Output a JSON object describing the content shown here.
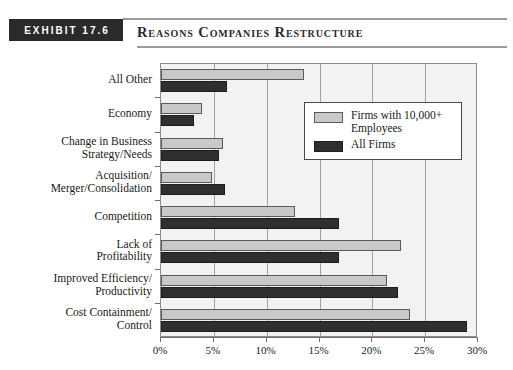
{
  "header": {
    "exhibit_label": "EXHIBIT 17.6",
    "title": "Reasons Companies Restructure"
  },
  "legend": {
    "items": [
      {
        "label": "Firms with 10,000+ Employees",
        "color": "#c9c9c9"
      },
      {
        "label": "All Firms",
        "color": "#2f2f2f"
      }
    ]
  },
  "chart_data": {
    "type": "bar",
    "orientation": "horizontal",
    "title": "Reasons Companies Restructure",
    "xlabel": "",
    "ylabel": "",
    "xlim": [
      0,
      30
    ],
    "xticks": [
      0,
      5,
      10,
      15,
      20,
      25,
      30
    ],
    "xticklabels": [
      "0%",
      "5%",
      "10%",
      "15%",
      "20%",
      "25%",
      "30%"
    ],
    "grid": true,
    "legend_position": "upper right",
    "categories": [
      "All Other",
      "Economy",
      "Change in Business Strategy/Needs",
      "Acquisition/ Merger/Consolidation",
      "Competition",
      "Lack of Profitability",
      "Improved Efficiency/ Productivity",
      "Cost Containment/ Control"
    ],
    "category_lines": [
      [
        "All Other"
      ],
      [
        "Economy"
      ],
      [
        "Change in Business",
        "Strategy/Needs"
      ],
      [
        "Acquisition/",
        "Merger/Consolidation"
      ],
      [
        "Competition"
      ],
      [
        "Lack of",
        "Profitability"
      ],
      [
        "Improved Efficiency/",
        "Productivity"
      ],
      [
        "Cost Containment/",
        "Control"
      ]
    ],
    "series": [
      {
        "name": "Firms with 10,000+ Employees",
        "color": "#c9c9c9",
        "values": [
          13.5,
          3.9,
          5.9,
          4.8,
          12.7,
          22.7,
          21.4,
          23.6
        ]
      },
      {
        "name": "All Firms",
        "color": "#2f2f2f",
        "values": [
          6.2,
          3.1,
          5.5,
          6.1,
          16.8,
          16.8,
          22.4,
          29.0
        ]
      }
    ]
  }
}
